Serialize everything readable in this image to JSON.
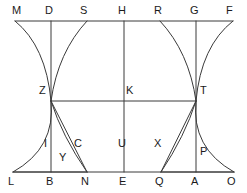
{
  "diagram": {
    "stroke_color": "#3a3a3a",
    "label_color": "#1a1a1a",
    "background_color": "#ffffff",
    "stroke_width": 1,
    "width": 247,
    "height": 193,
    "rows": {
      "top_line_y": 21,
      "middle_line_y": 101,
      "lower_line_y": 156,
      "bottom_line_y": 172
    },
    "verticals": {
      "left_x": 51,
      "center_x": 124,
      "right_x": 196
    },
    "labels": [
      {
        "text": "M",
        "x": 12,
        "y": 5,
        "name": "point-label-m"
      },
      {
        "text": "D",
        "x": 45,
        "y": 5,
        "name": "point-label-d"
      },
      {
        "text": "S",
        "x": 80,
        "y": 5,
        "name": "point-label-s"
      },
      {
        "text": "H",
        "x": 118,
        "y": 5,
        "name": "point-label-h"
      },
      {
        "text": "R",
        "x": 154,
        "y": 5,
        "name": "point-label-r"
      },
      {
        "text": "G",
        "x": 190,
        "y": 5,
        "name": "point-label-g"
      },
      {
        "text": "F",
        "x": 226,
        "y": 5,
        "name": "point-label-f"
      },
      {
        "text": "Z",
        "x": 39,
        "y": 85,
        "name": "point-label-z"
      },
      {
        "text": "K",
        "x": 126,
        "y": 85,
        "name": "point-label-k"
      },
      {
        "text": "T",
        "x": 200,
        "y": 85,
        "name": "point-label-t"
      },
      {
        "text": "I",
        "x": 44,
        "y": 138,
        "name": "point-label-i"
      },
      {
        "text": "C",
        "x": 74,
        "y": 138,
        "name": "point-label-c"
      },
      {
        "text": "U",
        "x": 118,
        "y": 138,
        "name": "point-label-u"
      },
      {
        "text": "X",
        "x": 154,
        "y": 138,
        "name": "point-label-x"
      },
      {
        "text": "Y",
        "x": 59,
        "y": 152,
        "name": "point-label-y"
      },
      {
        "text": "P",
        "x": 200,
        "y": 146,
        "name": "point-label-p"
      },
      {
        "text": "L",
        "x": 8,
        "y": 176,
        "name": "point-label-l"
      },
      {
        "text": "B",
        "x": 46,
        "y": 176,
        "name": "point-label-b"
      },
      {
        "text": "N",
        "x": 81,
        "y": 176,
        "name": "point-label-n"
      },
      {
        "text": "E",
        "x": 119,
        "y": 176,
        "name": "point-label-e"
      },
      {
        "text": "Q",
        "x": 155,
        "y": 176,
        "name": "point-label-q"
      },
      {
        "text": "A",
        "x": 191,
        "y": 176,
        "name": "point-label-a"
      },
      {
        "text": "O",
        "x": 227,
        "y": 176,
        "name": "point-label-o"
      }
    ],
    "points": {
      "M": [
        15,
        21
      ],
      "D": [
        51,
        21
      ],
      "S": [
        87,
        21
      ],
      "H": [
        124,
        21
      ],
      "R": [
        160,
        21
      ],
      "G": [
        196,
        21
      ],
      "F": [
        233,
        21
      ],
      "Z": [
        51,
        101
      ],
      "K": [
        124,
        101
      ],
      "T": [
        196,
        101
      ],
      "I": [
        51,
        145
      ],
      "C": [
        78,
        145
      ],
      "U": [
        124,
        145
      ],
      "X": [
        160,
        145
      ],
      "Y": [
        63,
        156
      ],
      "P": [
        196,
        156
      ],
      "L": [
        13,
        172
      ],
      "B": [
        51,
        172
      ],
      "N": [
        87,
        172
      ],
      "E": [
        124,
        172
      ],
      "Q": [
        161,
        172
      ],
      "A": [
        196,
        172
      ],
      "O": [
        234,
        172
      ]
    },
    "segments": [
      {
        "name": "line-top-MF",
        "from": "M",
        "to": "F"
      },
      {
        "name": "line-bottom-LO",
        "from": "L",
        "to": "O"
      },
      {
        "name": "line-middle-ZT",
        "from": "Z",
        "to": "T"
      },
      {
        "name": "line-lower-left",
        "from": "L",
        "to": "N"
      },
      {
        "name": "line-lower-right",
        "from": "Q",
        "to": "O"
      },
      {
        "name": "line-vertical-DB",
        "from": "D",
        "to": "B"
      },
      {
        "name": "line-vertical-HE",
        "from": "H",
        "to": "E"
      },
      {
        "name": "line-vertical-GA",
        "from": "G",
        "to": "A"
      },
      {
        "name": "line-chord-ZN",
        "from": "Z",
        "to": "N"
      },
      {
        "name": "line-chord-TQ",
        "from": "T",
        "to": "Q"
      }
    ],
    "curves": [
      {
        "name": "curve-M-to-Z",
        "from": "M",
        "to": "Z",
        "cx": 46,
        "cy": 46
      },
      {
        "name": "curve-S-to-Z",
        "from": "S",
        "to": "Z",
        "cx": 58,
        "cy": 52
      },
      {
        "name": "curve-R-to-T",
        "from": "R",
        "to": "T",
        "cx": 189,
        "cy": 52
      },
      {
        "name": "curve-F-to-T",
        "from": "F",
        "to": "T",
        "cx": 201,
        "cy": 46
      },
      {
        "name": "curve-Z-to-L",
        "from": "Z",
        "to": "L",
        "cx": 56,
        "cy": 148
      },
      {
        "name": "curve-Z-to-N",
        "from": "Z",
        "to": "N",
        "cx": 62,
        "cy": 136
      },
      {
        "name": "curve-T-to-Q",
        "from": "T",
        "to": "Q",
        "cx": 185,
        "cy": 136
      },
      {
        "name": "curve-T-to-O",
        "from": "T",
        "to": "O",
        "cx": 191,
        "cy": 148
      }
    ]
  }
}
